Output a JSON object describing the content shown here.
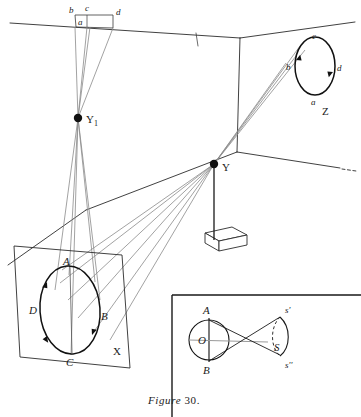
{
  "figure": {
    "caption_word": "Figure",
    "caption_number": "30.",
    "title": "Figure 30."
  },
  "colors": {
    "ink": "#1a1a1a",
    "ray_gray": "#7a7a7a",
    "room_line": "#2b2b2b",
    "paper": "#ffffff"
  },
  "scene": {
    "projector_near": {
      "label": "Y1",
      "label_sub": "1",
      "label_main": "Y"
    },
    "projector_far": {
      "label": "Y"
    },
    "ceiling_slide": {
      "name": "ceiling-slide-rectangle",
      "labels": {
        "left": "b",
        "top": "c",
        "inner": "a",
        "right": "d"
      }
    },
    "wall_z": {
      "label": "Z",
      "ellipse_labels": {
        "top": "c",
        "left": "b",
        "right": "d",
        "bottom": "a"
      }
    },
    "screen_x": {
      "label": "X",
      "ellipse_labels": {
        "top": "A",
        "left": "D",
        "right": "B",
        "bottom": "C"
      }
    },
    "stand": {
      "name": "projector-table"
    }
  },
  "inset": {
    "labels": {
      "top": "A",
      "center": "O",
      "bottom": "B",
      "vertex": "S",
      "image_top": "s'",
      "image_bottom": "s''"
    }
  }
}
